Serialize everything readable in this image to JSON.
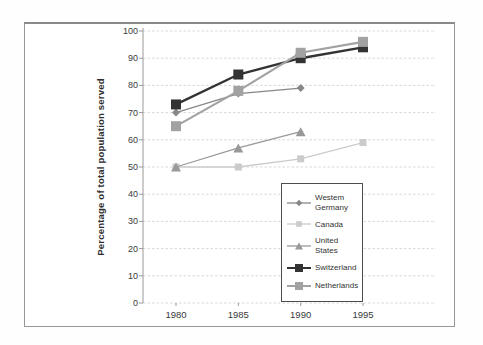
{
  "figure": {
    "y_axis_label": "Percentage of total population served",
    "background_color": "#ffffff",
    "frame_border_color": "#8f8f8f",
    "gridline_color": "#d8d8d8",
    "axis_color": "#9a9a9a",
    "legend_border_color": "#4d4d4d"
  },
  "chart_data": {
    "type": "line",
    "title": "",
    "xlabel": "",
    "ylabel": "Percentage of total population served",
    "categories": [
      "1980",
      "1985",
      "1990",
      "1995"
    ],
    "ylim": [
      0,
      100
    ],
    "yticks": [
      0,
      10,
      20,
      30,
      40,
      50,
      60,
      70,
      80,
      90,
      100
    ],
    "grid": true,
    "legend_position": "inside-lower-right",
    "series": [
      {
        "name": "Westem Germany",
        "values": [
          70,
          77,
          79,
          null
        ],
        "color": "#878787",
        "marker": "diamond",
        "marker_size": 8,
        "line_width": 1.3
      },
      {
        "name": "Canada",
        "values": [
          50,
          50,
          53,
          59
        ],
        "color": "#cbcbcb",
        "marker": "square",
        "marker_size": 7,
        "line_width": 1.3
      },
      {
        "name": "United States",
        "values": [
          50,
          57,
          63,
          null
        ],
        "color": "#999999",
        "marker": "triangle",
        "marker_size": 9,
        "line_width": 1.3
      },
      {
        "name": "Switzerland",
        "values": [
          73,
          84,
          90,
          94
        ],
        "color": "#333333",
        "marker": "square",
        "marker_size": 10,
        "line_width": 2.4
      },
      {
        "name": "Netherlands",
        "values": [
          65,
          78,
          92,
          96
        ],
        "color": "#a2a2a2",
        "marker": "square",
        "marker_size": 10,
        "line_width": 2.1
      }
    ]
  }
}
